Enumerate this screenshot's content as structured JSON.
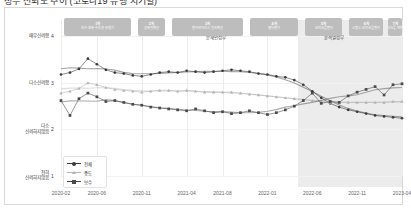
{
  "title": "정부 신뢰도 추이 (코로나19 유행 시기별)",
  "chart_data": {
    "type": "line",
    "title": "정부 신뢰도 추이 (코로나19 유행 시기별)",
    "xlabel": "",
    "ylabel": "",
    "grid": true,
    "legend_position": "bottom-left",
    "ylim": [
      1,
      4.35
    ],
    "ytick_values": [
      4,
      3,
      2,
      1
    ],
    "ytick_labels": [
      "4",
      "3",
      "2",
      "1"
    ],
    "ycategory_labels": [
      "매우신뢰함",
      "다소신뢰함",
      "다소 신뢰하지않음",
      "전혀 신뢰하지않음"
    ],
    "xtick_labels": [
      "2020-02",
      "2020-06",
      "2020-11",
      "2021-04",
      "2021-08",
      "2022-01",
      "2022-06",
      "2022-11",
      "2023-04"
    ],
    "x": [
      "2020-02",
      "2020-03",
      "2020-04",
      "2020-05",
      "2020-06",
      "2020-07",
      "2020-08",
      "2020-09",
      "2020-10",
      "2020-11",
      "2020-12",
      "2021-01",
      "2021-02",
      "2021-03",
      "2021-04",
      "2021-05",
      "2021-06",
      "2021-07",
      "2021-08",
      "2021-09",
      "2021-10",
      "2021-11",
      "2021-12",
      "2022-01",
      "2022-02",
      "2022-03",
      "2022-04",
      "2022-05",
      "2022-06",
      "2022-07",
      "2022-08",
      "2022-09",
      "2022-10",
      "2022-11",
      "2022-12",
      "2023-01",
      "2023-02",
      "2023-03",
      "2023-04"
    ],
    "series": [
      {
        "name": "진보",
        "color": "#3a3a3a",
        "marker": "circle",
        "values": [
          3.18,
          3.22,
          3.3,
          3.52,
          3.4,
          3.28,
          3.22,
          3.2,
          3.16,
          3.14,
          3.18,
          3.22,
          3.24,
          3.22,
          3.26,
          3.24,
          3.22,
          3.24,
          3.26,
          3.28,
          3.26,
          3.24,
          3.2,
          3.18,
          3.14,
          3.12,
          3.06,
          2.96,
          2.82,
          2.68,
          2.56,
          2.48,
          2.42,
          2.38,
          2.34,
          2.3,
          2.28,
          2.26,
          2.24
        ]
      },
      {
        "name": "중도",
        "color": "#b4b4b4",
        "marker": "triangle",
        "values": [
          2.78,
          2.82,
          2.88,
          3.0,
          2.96,
          2.9,
          2.86,
          2.84,
          2.82,
          2.8,
          2.82,
          2.84,
          2.84,
          2.82,
          2.84,
          2.82,
          2.8,
          2.8,
          2.8,
          2.8,
          2.78,
          2.76,
          2.74,
          2.72,
          2.7,
          2.68,
          2.66,
          2.64,
          2.62,
          2.6,
          2.58,
          2.58,
          2.58,
          2.58,
          2.58,
          2.58,
          2.58,
          2.6,
          2.6
        ]
      },
      {
        "name": "보수",
        "color": "#4a4a4a",
        "marker": "square",
        "values": [
          2.62,
          2.3,
          2.66,
          2.78,
          2.7,
          2.6,
          2.62,
          2.58,
          2.54,
          2.52,
          2.48,
          2.46,
          2.44,
          2.42,
          2.4,
          2.44,
          2.4,
          2.36,
          2.38,
          2.34,
          2.36,
          2.4,
          2.36,
          2.32,
          2.36,
          2.42,
          2.5,
          2.62,
          2.78,
          2.56,
          2.6,
          2.58,
          2.72,
          2.8,
          2.86,
          2.92,
          2.74,
          2.96,
          2.98
        ]
      }
    ],
    "legend": [
      {
        "label": "전체",
        "marker": "circle",
        "color": "#3a3a3a"
      },
      {
        "label": "중도",
        "marker": "triangle",
        "color": "#b4b4b4"
      },
      {
        "label": "보수",
        "marker": "square",
        "color": "#4a4a4a"
      }
    ],
    "bands": [
      {
        "n": "1차",
        "d": "대구·경북·수도권 유행기",
        "start": 0.01,
        "end": 0.205
      },
      {
        "n": "2차",
        "d": "광복절확산",
        "start": 0.225,
        "end": 0.305
      },
      {
        "n": "3차",
        "d": "변이바이러스 전국확산",
        "start": 0.325,
        "end": 0.535
      },
      {
        "n": "4차",
        "d": "델타변이",
        "start": 0.555,
        "end": 0.695
      },
      {
        "n": "5차",
        "d": "오미크론변이",
        "start": 0.715,
        "end": 0.825
      },
      {
        "n": "6차",
        "d": "스텔스 오미크론변이",
        "start": 0.845,
        "end": 0.945
      },
      {
        "n": "7차",
        "d": "오미크론 재확산",
        "start": 0.96,
        "end": 1.0
      }
    ],
    "governments": [
      {
        "label": "문재인정부",
        "x": 0.455,
        "shaded": false
      },
      {
        "label": "윤석열정부",
        "x": 0.8,
        "shaded": true
      }
    ],
    "shade_start": 0.695
  }
}
